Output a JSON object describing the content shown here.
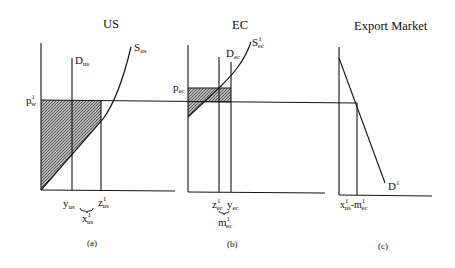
{
  "colors": {
    "line": "#151515",
    "shade_base": "#b4b4b4",
    "shade_dot": "#5a5a5a",
    "background": "#ffffff"
  },
  "panels": [
    {
      "title": "US",
      "caption": "(a)",
      "price": {
        "main": "p",
        "sup": "1",
        "sub": "w"
      },
      "demand": {
        "main": "D",
        "sub": "us"
      },
      "supply": {
        "main": "S",
        "sub": "us"
      },
      "consumption": {
        "main": "y",
        "sub": "us"
      },
      "production": {
        "main": "z",
        "sup": "1",
        "sub": "us"
      },
      "exports": {
        "main": "x",
        "sup": "1",
        "sub": "us"
      }
    },
    {
      "title": "EC",
      "caption": "(b)",
      "price": {
        "main": "p",
        "sub": "ec"
      },
      "demand": {
        "main": "D",
        "sub": "ec"
      },
      "supply": {
        "main": "S",
        "sup": "1",
        "sub": "ec"
      },
      "production": {
        "main": "z",
        "sup": "1",
        "sub": "ec"
      },
      "consumption": {
        "main": "y",
        "sub": "ec"
      },
      "imports": {
        "main": "m",
        "sup": "1",
        "sub": "ec"
      }
    },
    {
      "title": "Export Market",
      "caption": "(c)",
      "demand": {
        "main": "D",
        "sup": "1"
      },
      "quantity": {
        "x_main": "x",
        "x_sup": "1",
        "x_sub": "us",
        "minus": "-",
        "m_main": "m",
        "m_sup": "1",
        "m_sub": "ec"
      }
    }
  ]
}
